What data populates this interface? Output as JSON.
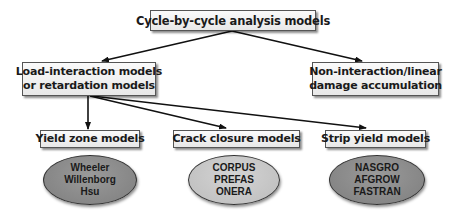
{
  "diagram": {
    "root": {
      "label": "Cycle-by-cycle analysis models"
    },
    "level2": [
      {
        "lines": [
          "Load-interaction models",
          "or retardation models"
        ]
      },
      {
        "lines": [
          "Non-interaction/linear",
          "damage accumulation"
        ]
      }
    ],
    "level3": [
      {
        "label": "Yield zone models",
        "examples": [
          "Wheeler",
          "Willenborg",
          "Hsu"
        ],
        "fill": "#8c8c8c"
      },
      {
        "label": "Crack closure models",
        "examples": [
          "CORPUS",
          "PREFAS",
          "ONERA"
        ],
        "fill": "#cacaca"
      },
      {
        "label": "Strip yield models",
        "examples": [
          "NASGRO",
          "AFGROW",
          "FASTRAN"
        ],
        "fill": "#8c8c8c"
      }
    ],
    "edges": [
      {
        "from": "Cycle-by-cycle analysis models",
        "to": "Load-interaction models or retardation models"
      },
      {
        "from": "Cycle-by-cycle analysis models",
        "to": "Non-interaction/linear damage accumulation"
      },
      {
        "from": "Load-interaction models or retardation models",
        "to": "Yield zone models"
      },
      {
        "from": "Load-interaction models or retardation models",
        "to": "Crack closure models"
      },
      {
        "from": "Load-interaction models or retardation models",
        "to": "Strip yield models"
      }
    ]
  }
}
